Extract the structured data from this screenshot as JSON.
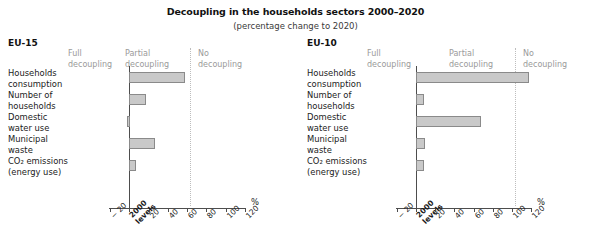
{
  "figure": {
    "title": "Decoupling in the households sectors 2000–2020",
    "subtitle": "(percentage change to 2020)",
    "unit_label": "%"
  },
  "zones": {
    "full": "Full\ndecoupling",
    "partial": "Partial\ndecoupling",
    "none": "No\ndecoupling"
  },
  "axis": {
    "ticks": [
      "− 20",
      "2000\nlevels",
      "20",
      "40",
      "60",
      "80",
      "100",
      "120"
    ],
    "tick_values": [
      -20,
      0,
      20,
      40,
      60,
      80,
      100,
      120
    ],
    "min": -20,
    "max": 120
  },
  "panels": [
    {
      "name": "EU-15",
      "title": "EU-15",
      "no_decoupling_threshold": 63
    },
    {
      "name": "EU-10",
      "title": "EU-10",
      "no_decoupling_threshold": 103
    }
  ],
  "chart_data": {
    "type": "bar",
    "title": "Decoupling in the households sectors 2000–2020",
    "subtitle": "(percentage change to 2020)",
    "orientation": "horizontal",
    "xlabel": "%",
    "ylabel": "",
    "xlim": [
      -20,
      120
    ],
    "xticks": [
      -20,
      0,
      20,
      40,
      60,
      80,
      100,
      120
    ],
    "xticklabels": [
      "− 20",
      "2000 levels",
      "20",
      "40",
      "60",
      "80",
      "100",
      "120"
    ],
    "grid": false,
    "legend": "none",
    "zone_annotations": [
      {
        "label": "Full decoupling",
        "range": [
          -20,
          0
        ]
      },
      {
        "label": "Partial decoupling",
        "range": [
          0,
          63
        ]
      },
      {
        "label": "No decoupling",
        "range": [
          63,
          120
        ]
      }
    ],
    "categories": [
      "Households\nconsumption",
      "Number of\nhouseholds",
      "Domestic\nwater use",
      "Municipal\nwaste",
      "CO₂ emissions\n(energy use)"
    ],
    "series": [
      {
        "name": "EU-15",
        "values": [
          58,
          17,
          -2,
          27,
          7
        ]
      },
      {
        "name": "EU-10",
        "values": [
          118,
          8,
          68,
          9,
          8
        ]
      }
    ],
    "bar_color": "#c9c9c9",
    "bar_edge_color": "#8a8a8a"
  }
}
